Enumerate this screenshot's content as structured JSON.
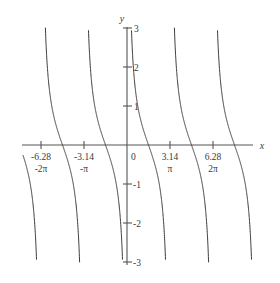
{
  "figure": {
    "axis_labels": {
      "x": "x",
      "y": "y"
    },
    "origin_label": "0"
  },
  "chart_data": {
    "type": "line",
    "title": "",
    "subtitle": "",
    "xlabel": "x",
    "ylabel": "y",
    "function": "y = cot(x)",
    "grid": false,
    "legend": false,
    "xlim": [
      -7.7,
      7.7
    ],
    "ylim": [
      -3,
      3
    ],
    "x_ticks": [
      {
        "value": -6.28,
        "label": "-6.28",
        "sublabel": "-2π"
      },
      {
        "value": -3.14,
        "label": "-3.14",
        "sublabel": "-π"
      },
      {
        "value": 3.14,
        "label": "3.14",
        "sublabel": "π"
      },
      {
        "value": 6.28,
        "label": "6.28",
        "sublabel": "2π"
      }
    ],
    "y_ticks": [
      {
        "value": 3,
        "label": "3"
      },
      {
        "value": 2,
        "label": "2"
      },
      {
        "value": 1,
        "label": "1"
      },
      {
        "value": -1,
        "label": "-1"
      },
      {
        "value": -2,
        "label": "-2"
      },
      {
        "value": -3,
        "label": "-3"
      }
    ],
    "asymptotes": [
      -6.283,
      -3.142,
      0,
      3.142,
      6.283
    ],
    "branches": [
      {
        "domain": [
          -9.425,
          -6.283
        ],
        "note": "partial branch, left edge clipped"
      },
      {
        "domain": [
          -6.283,
          -3.142
        ],
        "note": "full branch"
      },
      {
        "domain": [
          -3.142,
          0
        ],
        "note": "full branch"
      },
      {
        "domain": [
          0,
          3.142
        ],
        "note": "full branch"
      },
      {
        "domain": [
          3.142,
          6.283
        ],
        "note": "full branch"
      },
      {
        "domain": [
          6.283,
          9.425
        ],
        "note": "partial branch, right edge clipped"
      }
    ]
  },
  "style": {
    "background": "#ffffff",
    "curve_color": "#3a3a3a",
    "axis_color": "#555555",
    "text_color": "#3a3a3a"
  }
}
